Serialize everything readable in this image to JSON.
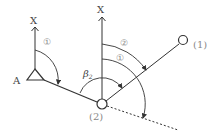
{
  "diagram": {
    "title": "",
    "labels": {
      "point_a": "A",
      "axis_left": "X",
      "axis_right": "X",
      "station_1": "(1)",
      "station_2": "(2)",
      "angle_left_1": "①",
      "angle_right_1": "①",
      "angle_right_2": "②",
      "beta": "β",
      "beta_sub": "2"
    },
    "colors": {
      "line": "#333333",
      "label": "#444444",
      "circled": "#888888",
      "background": "#ffffff"
    }
  }
}
